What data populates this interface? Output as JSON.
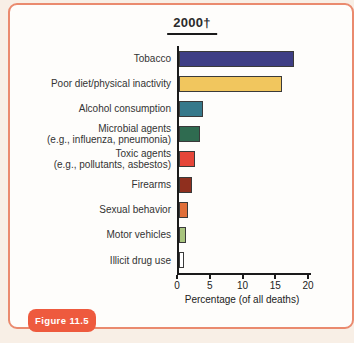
{
  "frame": {
    "border_color": "#ea8a6e",
    "background": "#fefdfb",
    "page_background": "#f8efe6"
  },
  "badge": {
    "label": "Figure 11.5",
    "background": "#ee5a3e",
    "text_color": "#ffffff"
  },
  "chart_data": {
    "type": "bar",
    "orientation": "horizontal",
    "title": "2000†",
    "xlabel": "Percentage (of all deaths)",
    "xlim": [
      0,
      20
    ],
    "xticks": [
      0,
      5,
      10,
      15,
      20
    ],
    "grid": false,
    "categories": [
      "Tobacco",
      "Poor diet/physical inactivity",
      "Alcohol consumption",
      "Microbial agents\n(e.g., influenza, pneumonia)",
      "Toxic agents\n(e.g., pollutants, asbestos)",
      "Firearms",
      "Sexual behavior",
      "Motor vehicles",
      "Illicit drug use"
    ],
    "values": [
      17.5,
      15.7,
      3.6,
      3.2,
      2.4,
      2.0,
      1.3,
      1.0,
      0.7
    ],
    "bar_colors": [
      "#3e3e85",
      "#f1c65e",
      "#36798b",
      "#2f6b50",
      "#e64639",
      "#8f2f1e",
      "#e06f3a",
      "#a8c47e",
      "#ffffff"
    ],
    "bar_outline": "#3a3a3a",
    "axis_color": "#1a1a1a"
  }
}
